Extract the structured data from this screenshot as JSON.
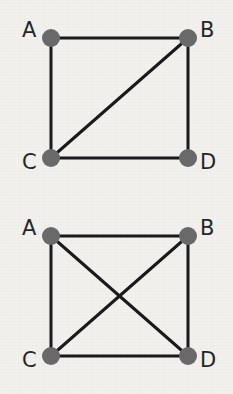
{
  "canvas": {
    "width": 233,
    "height": 394,
    "background_color": "#f2f1ee"
  },
  "style": {
    "node_color": "#6a6a6a",
    "node_radius": 9,
    "edge_color": "#1a1a1a",
    "edge_width": 3,
    "label_color": "#262626",
    "label_font_size": 21
  },
  "chart_data": {
    "type": "diagram",
    "title": "",
    "subtitle": "",
    "graphs": [
      {
        "id": "graph-top",
        "name": "upper-graph",
        "edge_count": 5,
        "nodes": [
          {
            "id": "A",
            "label": "A",
            "x": 51,
            "y": 38,
            "label_x": 22,
            "label_y": 20
          },
          {
            "id": "B",
            "label": "B",
            "x": 188,
            "y": 38,
            "label_x": 200,
            "label_y": 20
          },
          {
            "id": "C",
            "label": "C",
            "x": 51,
            "y": 158,
            "label_x": 22,
            "label_y": 152
          },
          {
            "id": "D",
            "label": "D",
            "x": 188,
            "y": 158,
            "label_x": 200,
            "label_y": 152
          }
        ],
        "edges": [
          {
            "from": "A",
            "to": "B",
            "kind": "side-top"
          },
          {
            "from": "A",
            "to": "C",
            "kind": "side-left"
          },
          {
            "from": "B",
            "to": "D",
            "kind": "side-right"
          },
          {
            "from": "C",
            "to": "D",
            "kind": "side-bottom"
          },
          {
            "from": "C",
            "to": "B",
            "kind": "diagonal"
          }
        ]
      },
      {
        "id": "graph-bottom",
        "name": "lower-graph",
        "edge_count": 6,
        "nodes": [
          {
            "id": "A",
            "label": "A",
            "x": 51,
            "y": 236,
            "label_x": 22,
            "label_y": 218
          },
          {
            "id": "B",
            "label": "B",
            "x": 188,
            "y": 236,
            "label_x": 200,
            "label_y": 218
          },
          {
            "id": "C",
            "label": "C",
            "x": 51,
            "y": 356,
            "label_x": 22,
            "label_y": 350
          },
          {
            "id": "D",
            "label": "D",
            "x": 188,
            "y": 356,
            "label_x": 200,
            "label_y": 350
          }
        ],
        "edges": [
          {
            "from": "A",
            "to": "B",
            "kind": "side-top"
          },
          {
            "from": "A",
            "to": "C",
            "kind": "side-left"
          },
          {
            "from": "B",
            "to": "D",
            "kind": "side-right"
          },
          {
            "from": "C",
            "to": "D",
            "kind": "side-bottom"
          },
          {
            "from": "A",
            "to": "D",
            "kind": "diagonal"
          },
          {
            "from": "C",
            "to": "B",
            "kind": "diagonal"
          }
        ]
      }
    ]
  }
}
